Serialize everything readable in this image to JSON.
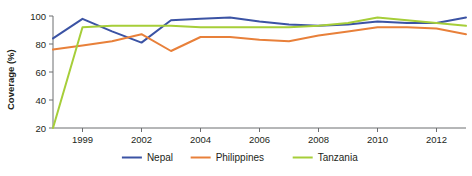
{
  "chart_data": {
    "type": "line",
    "title": "",
    "subtitle": "",
    "xlabel": "",
    "ylabel": "Coverage (%)",
    "ylim": [
      20,
      100
    ],
    "yticks": [
      20,
      40,
      60,
      80,
      100
    ],
    "ytick_labels": [
      "20",
      "40",
      "60",
      "80",
      "100"
    ],
    "grid": false,
    "legend_position": "bottom",
    "x": [
      "1998",
      "1999",
      "2000",
      "2001",
      "2002",
      "2003",
      "2004",
      "2005",
      "2006",
      "2007",
      "2008",
      "2009",
      "2010",
      "2011",
      "2012"
    ],
    "xticks": [
      "1999",
      "2002",
      "2004",
      "2006",
      "2008",
      "2010",
      "2012"
    ],
    "xtick_indices": [
      1,
      3,
      5,
      7,
      9,
      11,
      13
    ],
    "series": [
      {
        "name": "Nepal",
        "color": "#3b53a4",
        "values": [
          84,
          98,
          89,
          81,
          97,
          98,
          99,
          96,
          94,
          93,
          94,
          96,
          95,
          95,
          99
        ]
      },
      {
        "name": "Philippines",
        "color": "#e8803a",
        "values": [
          76,
          79,
          82,
          87,
          75,
          85,
          85,
          83,
          82,
          86,
          89,
          92,
          92,
          91,
          87
        ]
      },
      {
        "name": "Tanzania",
        "color": "#a6ce39",
        "values": [
          20,
          92,
          93,
          93,
          93,
          92,
          92,
          92,
          92,
          93,
          95,
          99,
          97,
          95,
          93
        ]
      }
    ]
  },
  "legend": {
    "items": [
      {
        "label": "Nepal",
        "color": "#3b53a4"
      },
      {
        "label": "Philippines",
        "color": "#e8803a"
      },
      {
        "label": "Tanzania",
        "color": "#a6ce39"
      }
    ]
  },
  "axes": {
    "y_axis_title": "Coverage (%)"
  }
}
